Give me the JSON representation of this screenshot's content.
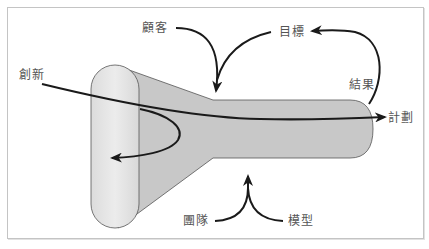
{
  "diagram": {
    "type": "concept-flow",
    "labels": {
      "innovation": "創新",
      "customer": "顧客",
      "goal": "目標",
      "result": "結果",
      "plan": "計劃",
      "team": "團隊",
      "model": "模型"
    },
    "colors": {
      "frame_border": "#c4c4c4",
      "capsule_fill": "#e4e4e4",
      "funnel_fill": "#c8c8c8",
      "outline": "#555555",
      "arrow": "#1a1a1a",
      "label_text": "#555555"
    },
    "edges": [
      {
        "from": "創新",
        "to": "計劃",
        "style": "arrow through funnel"
      },
      {
        "from": "創新",
        "to": "funnel-mouth",
        "style": "loop back arrow"
      },
      {
        "from": "顧客",
        "to": "funnel-neck",
        "style": "curved arrow"
      },
      {
        "from": "目標",
        "to": "funnel-neck",
        "style": "curved arrow"
      },
      {
        "from": "結果",
        "to": "目標",
        "style": "curved arrow"
      },
      {
        "from": "團隊",
        "to": "funnel",
        "style": "merging arrow"
      },
      {
        "from": "模型",
        "to": "funnel",
        "style": "merging arrow"
      }
    ]
  }
}
